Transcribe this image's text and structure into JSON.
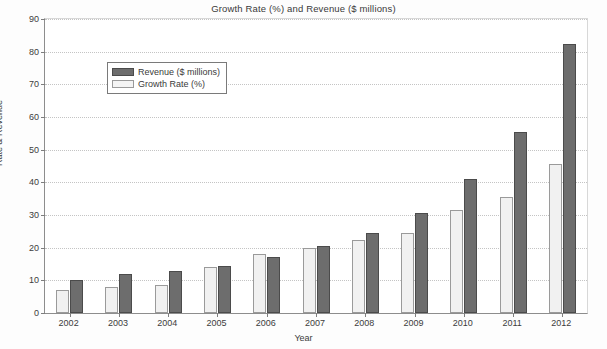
{
  "chart_data": {
    "type": "bar",
    "title": "Growth Rate (%) and Revenue ($ millions)",
    "xlabel": "Year",
    "ylabel": "Rate & Revenue",
    "categories": [
      "2002",
      "2003",
      "2004",
      "2005",
      "2006",
      "2007",
      "2008",
      "2009",
      "2010",
      "2011",
      "2012"
    ],
    "series": [
      {
        "name": "Growth Rate (%)",
        "color": "#f1f1f1",
        "values": [
          7,
          8,
          8.5,
          14,
          18,
          20,
          22.5,
          24.5,
          31.5,
          35.5,
          45.5
        ]
      },
      {
        "name": "Revenue ($ millions)",
        "color": "#6d6d6d",
        "values": [
          10,
          12,
          13,
          14.5,
          17,
          20.5,
          24.5,
          30.5,
          41,
          55.5,
          82.5
        ]
      }
    ],
    "ylim": [
      0,
      90
    ],
    "yticks": [
      0,
      10,
      20,
      30,
      40,
      50,
      60,
      70,
      80,
      90
    ],
    "ytick_labels": [
      "0",
      "10",
      "20",
      "30",
      "40",
      "50",
      "60",
      "70",
      "80",
      "90"
    ],
    "grid": true,
    "legend_position": "top-left",
    "legend_entries": [
      "Revenue ($ millions)",
      "Growth Rate (%)"
    ]
  },
  "legend": {
    "revenue_label": "Revenue ($ millions)",
    "growth_label": "Growth Rate (%)"
  }
}
